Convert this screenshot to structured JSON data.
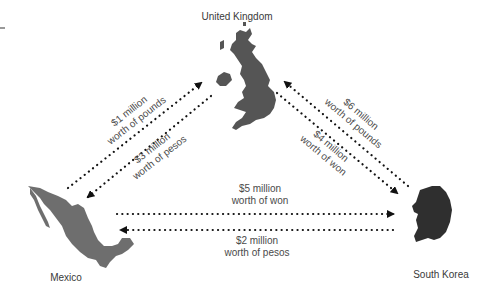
{
  "colors": {
    "background": "#ffffff",
    "uk_fill": "#555555",
    "mexico_fill": "#6e6e6e",
    "korea_fill": "#2f2f2f",
    "arrow": "#111111",
    "text": "#444444"
  },
  "countries": {
    "uk": {
      "label": "United Kingdom"
    },
    "mexico": {
      "label": "Mexico"
    },
    "south_korea": {
      "label": "South Korea"
    }
  },
  "flows": [
    {
      "id": "mx-to-uk",
      "from": "Mexico",
      "to": "United Kingdom",
      "amount": "$1 million",
      "currency": "worth of pounds"
    },
    {
      "id": "uk-to-mx",
      "from": "United Kingdom",
      "to": "Mexico",
      "amount": "$3 million",
      "currency": "worth of pesos"
    },
    {
      "id": "kr-to-uk",
      "from": "South Korea",
      "to": "United Kingdom",
      "amount": "$6 million",
      "currency": "worth of pounds"
    },
    {
      "id": "uk-to-kr",
      "from": "United Kingdom",
      "to": "South Korea",
      "amount": "$4 million",
      "currency": "worth of won"
    },
    {
      "id": "mx-to-kr",
      "from": "Mexico",
      "to": "South Korea",
      "amount": "$5 million",
      "currency": "worth of won"
    },
    {
      "id": "kr-to-mx",
      "from": "South Korea",
      "to": "Mexico",
      "amount": "$2 million",
      "currency": "worth of pesos"
    }
  ]
}
